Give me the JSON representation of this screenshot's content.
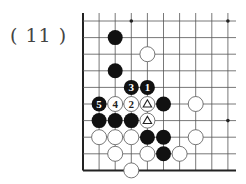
{
  "problem": {
    "label": "( 11 )"
  },
  "board": {
    "origin_x": 83,
    "origin_y": 21,
    "spacing_x": 16.1,
    "spacing_y": 16.6,
    "cols": 10,
    "rows": 10,
    "right_extent": 236,
    "left_edge": true,
    "bottom_edge": true,
    "stone_radius": 7.5,
    "colors": {
      "line": "#555555",
      "edge": "#222222",
      "black": "#111111",
      "white": "#ffffff",
      "white_stroke": "#555555"
    },
    "star_points": [
      {
        "col": 3,
        "row": 0
      },
      {
        "col": 9,
        "row": 0
      },
      {
        "col": 9,
        "row": 6
      }
    ],
    "stones": [
      {
        "col": 2,
        "row": 1,
        "color": "black"
      },
      {
        "col": 4,
        "row": 2,
        "color": "white"
      },
      {
        "col": 2,
        "row": 3,
        "color": "black"
      },
      {
        "col": 3,
        "row": 4,
        "color": "black",
        "label": "3"
      },
      {
        "col": 4,
        "row": 4,
        "color": "black",
        "label": "1"
      },
      {
        "col": 1,
        "row": 5,
        "color": "black",
        "label": "5"
      },
      {
        "col": 2,
        "row": 5,
        "color": "white",
        "label": "4"
      },
      {
        "col": 3,
        "row": 5,
        "color": "white",
        "label": "2"
      },
      {
        "col": 4,
        "row": 5,
        "color": "white",
        "mark": "triangle"
      },
      {
        "col": 5,
        "row": 5,
        "color": "black"
      },
      {
        "col": 7,
        "row": 5,
        "color": "white"
      },
      {
        "col": 1,
        "row": 6,
        "color": "black"
      },
      {
        "col": 2,
        "row": 6,
        "color": "black"
      },
      {
        "col": 3,
        "row": 6,
        "color": "black"
      },
      {
        "col": 4,
        "row": 6,
        "color": "white",
        "mark": "triangle"
      },
      {
        "col": 1,
        "row": 7,
        "color": "white"
      },
      {
        "col": 2,
        "row": 7,
        "color": "white"
      },
      {
        "col": 3,
        "row": 7,
        "color": "white"
      },
      {
        "col": 4,
        "row": 7,
        "color": "black"
      },
      {
        "col": 5,
        "row": 7,
        "color": "black"
      },
      {
        "col": 7,
        "row": 7,
        "color": "white"
      },
      {
        "col": 2,
        "row": 8,
        "color": "white"
      },
      {
        "col": 4,
        "row": 8,
        "color": "white"
      },
      {
        "col": 5,
        "row": 8,
        "color": "black"
      },
      {
        "col": 6,
        "row": 8,
        "color": "white"
      },
      {
        "col": 3,
        "row": 9,
        "color": "white"
      }
    ]
  }
}
